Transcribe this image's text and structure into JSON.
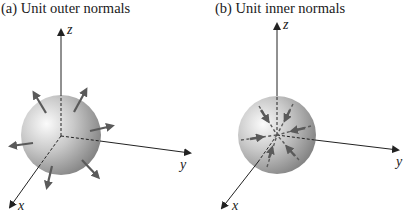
{
  "panels": [
    {
      "id": "a",
      "title": "(a)  Unit outer normals",
      "axes": {
        "z": "z",
        "y": "y",
        "x": "x"
      },
      "normals": "outward"
    },
    {
      "id": "b",
      "title": "(b)  Unit inner normals",
      "axes": {
        "z": "z",
        "y": "y",
        "x": "x"
      },
      "normals": "inward"
    }
  ],
  "colors": {
    "arrow": "#5a5a5a",
    "axis": "#222222",
    "sphere_light": "#f4f4f4",
    "sphere_dark": "#8a8a8a"
  }
}
